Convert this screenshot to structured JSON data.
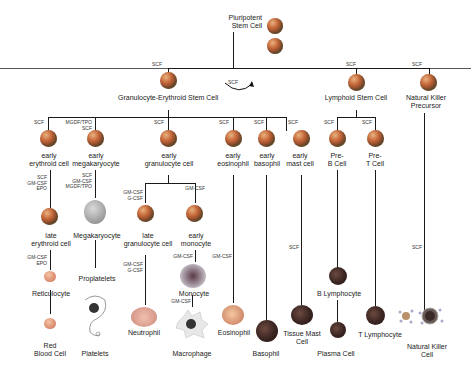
{
  "cells": {
    "pluripotent": "Pluripotent\nStem Cell",
    "granulocyte_erythroid": "Granulocyte-Erythroid Stem Cell",
    "lymphoid": "Lymphoid Stem Cell",
    "nk_precursor": "Natural Killer\nPrecursor",
    "early_erythroid": "early\nerythroid cell",
    "early_megakaryocyte": "early\nmegakaryocyte",
    "early_granulocyte": "early\ngranulocyte cell",
    "early_eosinophil": "early\neosinophil",
    "early_basophil": "early\nbasophil",
    "early_mast": "early\nmast cell",
    "pre_b": "Pre-\nB Cell",
    "pre_t": "Pre-\nT Cell",
    "late_erythroid": "late\nerythroid cell",
    "megakaryocyte": "Megakaryocyte",
    "late_granulocyte": "late\ngranulocyte cell",
    "early_monocyte": "early\nmonocyte",
    "reticulocyte": "Reticulocyte",
    "proplatelets": "Proplatelets",
    "monocyte": "Monocyte",
    "b_lymphocyte": "B Lymphocyte",
    "red_blood_cell": "Red\nBlood Cell",
    "platelets": "Platelets",
    "neutrophil": "Neutrophil",
    "macrophage": "Macrophage",
    "eosinophil": "Eosinophil",
    "basophil": "Basophil",
    "tissue_mast": "Tissue Mast\nCell",
    "plasma_cell": "Plasma Cell",
    "t_lymphocyte": "T Lymphocyte",
    "natural_killer": "Natural Killer\nCell"
  },
  "factors": {
    "self_renew": "SCF",
    "ge_stem": "SCF",
    "lymphoid": "SCF",
    "nk_prec": "SCF",
    "early_erythroid": "SCF",
    "early_mega": "MGDF/TPO\nSCF",
    "early_gran": "SCF",
    "early_eos": "SCF",
    "early_baso": "SCF",
    "early_mast": "SCF",
    "pre_b": "SCF",
    "pre_t": "SCF",
    "late_erythroid": "SCF\nGM-CSF\nEPO",
    "megakaryocyte": "SCF\nGM-CSF\nMGDF/TPO",
    "late_gran": "GM-CSF\nG-CSF",
    "early_mono": "GM-CSF",
    "reticulocyte": "GM-CSF\nEPO",
    "neutrophil": "GM-CSF\nG-CSF",
    "monocyte": "GM-CSF",
    "eosinophil": "GM-CSF",
    "macrophage": "GM-CSF",
    "tissue_mast": "SCF",
    "nk_cell": "SCF"
  }
}
